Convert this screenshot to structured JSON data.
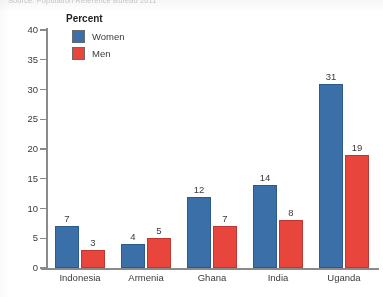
{
  "source_note": "Source: Population Reference Bureau 2011",
  "legend": {
    "title": "Percent",
    "entries": [
      {
        "label": "Women",
        "color": "#3a6fa8",
        "name": "women"
      },
      {
        "label": "Men",
        "color": "#e8453c",
        "name": "men"
      }
    ]
  },
  "chart_data": {
    "type": "bar",
    "title": "",
    "subtitle": "",
    "xlabel": "",
    "ylabel": "Percent",
    "ylim": [
      0,
      40
    ],
    "yticks": [
      0,
      5,
      10,
      15,
      20,
      25,
      30,
      35,
      40
    ],
    "ytick_labels": [
      "0",
      "5",
      "10",
      "15",
      "20",
      "25",
      "30",
      "35",
      "40"
    ],
    "grid": false,
    "legend_position": "top-left-inside",
    "categories": [
      "Indonesia",
      "Armenia",
      "Ghana",
      "India",
      "Uganda"
    ],
    "series": [
      {
        "name": "Women",
        "color": "#3a6fa8",
        "values": [
          7,
          4,
          12,
          14,
          31
        ],
        "labels": [
          "7",
          "4",
          "12",
          "14",
          "31"
        ]
      },
      {
        "name": "Men",
        "color": "#e8453c",
        "values": [
          3,
          5,
          7,
          8,
          19
        ],
        "labels": [
          "3",
          "5",
          "7",
          "8",
          "19"
        ]
      }
    ],
    "annotations": []
  }
}
